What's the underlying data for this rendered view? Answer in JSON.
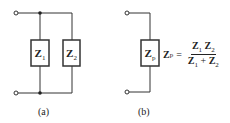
{
  "diagram_a": {
    "caption": "(a)",
    "impedances": [
      {
        "symbol": "Z",
        "subscript": "1"
      },
      {
        "symbol": "Z",
        "subscript": "2"
      }
    ]
  },
  "diagram_b": {
    "caption": "(b)",
    "impedance": {
      "symbol": "Z",
      "subscript": "p"
    },
    "equation": {
      "lhs": "Z",
      "lhs_sub": "p",
      "equals": "=",
      "num": [
        {
          "s": "Z",
          "sub": "1"
        },
        {
          "s": "Z",
          "sub": "2"
        }
      ],
      "den": [
        {
          "s": "Z",
          "sub": "1"
        },
        {
          "s": "+"
        },
        {
          "s": "Z",
          "sub": "2"
        }
      ]
    }
  }
}
